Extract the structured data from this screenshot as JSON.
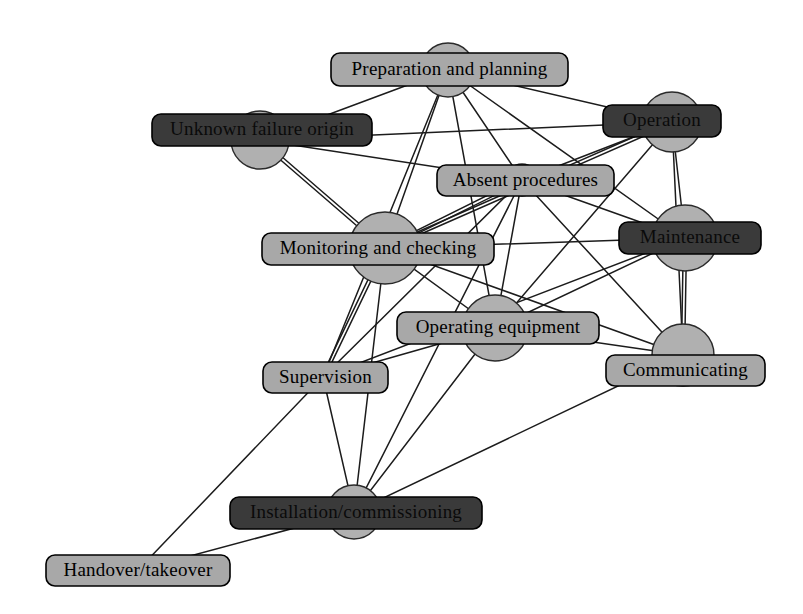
{
  "diagram": {
    "type": "node-link-network",
    "canvas": {
      "width": 803,
      "height": 614
    },
    "style": {
      "background_color": "#ffffff",
      "node_fill_color": "#b0b0b0",
      "node_stroke_color": "#2a2a2a",
      "edge_color": "#1c1c1c",
      "light_label_fill": "#a8a8a8",
      "dark_label_fill": "#3a3a3a",
      "label_text_color": "#000000"
    },
    "nodes": [
      {
        "id": "preparation",
        "label": "Preparation and planning",
        "cx": 448,
        "cy": 70,
        "r": 27,
        "box": {
          "x": 331,
          "y": 53,
          "w": 237,
          "h": 33,
          "fill": "light"
        },
        "font_size": 19
      },
      {
        "id": "unknown_failure",
        "label": "Unknown failure origin",
        "cx": 260,
        "cy": 140,
        "r": 29,
        "box": {
          "x": 152,
          "y": 114,
          "w": 220,
          "h": 32,
          "fill": "dark"
        },
        "font_size": 19
      },
      {
        "id": "operation",
        "label": "Operation",
        "cx": 672,
        "cy": 122,
        "r": 30,
        "box": {
          "x": 603,
          "y": 105,
          "w": 118,
          "h": 32,
          "fill": "dark"
        },
        "font_size": 19
      },
      {
        "id": "absent_procedures",
        "label": "Absent procedures",
        "cx": 522,
        "cy": 180,
        "r": 16,
        "box": {
          "x": 437,
          "y": 165,
          "w": 177,
          "h": 31,
          "fill": "light"
        },
        "font_size": 19
      },
      {
        "id": "monitoring",
        "label": "Monitoring and checking",
        "cx": 385,
        "cy": 248,
        "r": 36,
        "box": {
          "x": 262,
          "y": 233,
          "w": 232,
          "h": 32,
          "fill": "light"
        },
        "font_size": 19
      },
      {
        "id": "maintenance",
        "label": "Maintenance",
        "cx": 685,
        "cy": 238,
        "r": 33,
        "box": {
          "x": 619,
          "y": 222,
          "w": 142,
          "h": 32,
          "fill": "dark"
        },
        "font_size": 19
      },
      {
        "id": "operating_equipment",
        "label": "Operating equipment",
        "cx": 495,
        "cy": 328,
        "r": 33,
        "box": {
          "x": 397,
          "y": 312,
          "w": 202,
          "h": 32,
          "fill": "light"
        },
        "font_size": 19
      },
      {
        "id": "communicating",
        "label": "Communicating",
        "cx": 683,
        "cy": 355,
        "r": 31,
        "box": {
          "x": 606,
          "y": 355,
          "w": 159,
          "h": 31,
          "fill": "light"
        },
        "font_size": 19
      },
      {
        "id": "supervision",
        "label": "Supervision",
        "cx": 323,
        "cy": 377,
        "r": 14,
        "box": {
          "x": 263,
          "y": 362,
          "w": 125,
          "h": 31,
          "fill": "light"
        },
        "font_size": 19
      },
      {
        "id": "installation",
        "label": "Installation/commissioning",
        "cx": 354,
        "cy": 512,
        "r": 27,
        "box": {
          "x": 230,
          "y": 497,
          "w": 252,
          "h": 32,
          "fill": "dark"
        },
        "font_size": 19
      },
      {
        "id": "handover",
        "label": "Handover/takeover",
        "cx": 138,
        "cy": 570,
        "r": 0,
        "box": {
          "x": 46,
          "y": 555,
          "w": 184,
          "h": 31,
          "fill": "light"
        },
        "font_size": 19
      }
    ],
    "edges": [
      {
        "from": "preparation",
        "to": "unknown_failure",
        "weight": 1
      },
      {
        "from": "preparation",
        "to": "monitoring",
        "weight": 1
      },
      {
        "from": "preparation",
        "to": "absent_procedures",
        "weight": 1
      },
      {
        "from": "preparation",
        "to": "operation",
        "weight": 1
      },
      {
        "from": "preparation",
        "to": "maintenance",
        "weight": 1
      },
      {
        "from": "preparation",
        "to": "operating_equipment",
        "weight": 1
      },
      {
        "from": "preparation",
        "to": "supervision",
        "weight": 1
      },
      {
        "from": "unknown_failure",
        "to": "absent_procedures",
        "weight": 1
      },
      {
        "from": "unknown_failure",
        "to": "monitoring",
        "weight": 2
      },
      {
        "from": "unknown_failure",
        "to": "operation",
        "weight": 1
      },
      {
        "from": "operation",
        "to": "absent_procedures",
        "weight": 1
      },
      {
        "from": "operation",
        "to": "monitoring",
        "weight": 2
      },
      {
        "from": "operation",
        "to": "maintenance",
        "weight": 1
      },
      {
        "from": "operation",
        "to": "operating_equipment",
        "weight": 1
      },
      {
        "from": "operation",
        "to": "communicating",
        "weight": 1
      },
      {
        "from": "absent_procedures",
        "to": "monitoring",
        "weight": 2
      },
      {
        "from": "absent_procedures",
        "to": "maintenance",
        "weight": 1
      },
      {
        "from": "absent_procedures",
        "to": "operating_equipment",
        "weight": 1
      },
      {
        "from": "absent_procedures",
        "to": "communicating",
        "weight": 1
      },
      {
        "from": "absent_procedures",
        "to": "supervision",
        "weight": 1
      },
      {
        "from": "absent_procedures",
        "to": "installation",
        "weight": 1
      },
      {
        "from": "monitoring",
        "to": "maintenance",
        "weight": 1
      },
      {
        "from": "monitoring",
        "to": "operating_equipment",
        "weight": 1
      },
      {
        "from": "monitoring",
        "to": "communicating",
        "weight": 1
      },
      {
        "from": "monitoring",
        "to": "supervision",
        "weight": 2
      },
      {
        "from": "monitoring",
        "to": "installation",
        "weight": 1
      },
      {
        "from": "maintenance",
        "to": "operating_equipment",
        "weight": 1
      },
      {
        "from": "maintenance",
        "to": "communicating",
        "weight": 2
      },
      {
        "from": "maintenance",
        "to": "supervision",
        "weight": 1
      },
      {
        "from": "operating_equipment",
        "to": "communicating",
        "weight": 1
      },
      {
        "from": "operating_equipment",
        "to": "supervision",
        "weight": 1
      },
      {
        "from": "operating_equipment",
        "to": "installation",
        "weight": 1
      },
      {
        "from": "communicating",
        "to": "installation",
        "weight": 1
      },
      {
        "from": "supervision",
        "to": "installation",
        "weight": 1
      },
      {
        "from": "supervision",
        "to": "handover",
        "weight": 1
      },
      {
        "from": "installation",
        "to": "handover",
        "weight": 1
      }
    ]
  }
}
